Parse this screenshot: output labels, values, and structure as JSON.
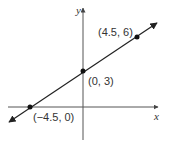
{
  "diagram": {
    "type": "line-graph",
    "axes": {
      "x_label": "x",
      "y_label": "y"
    },
    "points": [
      {
        "label": "(−4.5, 0)",
        "x": -4.5,
        "y": 0
      },
      {
        "label": "(0, 3)",
        "x": 0,
        "y": 3
      },
      {
        "label": "(4.5, 6)",
        "x": 4.5,
        "y": 6
      }
    ],
    "line_color": "#111111",
    "axis_color": "#555555"
  }
}
